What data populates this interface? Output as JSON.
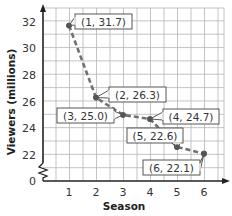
{
  "chart_data": {
    "type": "line",
    "title": "",
    "xlabel": "Season",
    "ylabel": "Viewers (millions)",
    "x": [
      1,
      2,
      3,
      4,
      5,
      6
    ],
    "series": [
      {
        "name": "Viewers",
        "values": [
          31.7,
          26.3,
          25.0,
          24.7,
          22.6,
          22.1
        ],
        "style": "dashed",
        "color": "#707070"
      }
    ],
    "x_ticks": [
      "1",
      "2",
      "3",
      "4",
      "5",
      "6"
    ],
    "y_ticks": [
      "0",
      "22",
      "24",
      "26",
      "28",
      "30",
      "32"
    ],
    "ylim": [
      0,
      32
    ],
    "y_axis_break": true,
    "grid": true,
    "legend": null,
    "annotations": [
      "(1, 31.7)",
      "(2, 26.3)",
      "(3, 25.0)",
      "(4, 24.7)",
      "(5, 22.6)",
      "(6, 22.1)"
    ]
  },
  "colors": {
    "grid": "#b5b5b5",
    "axis": "#222222",
    "line": "#707070",
    "point": "#555555"
  }
}
